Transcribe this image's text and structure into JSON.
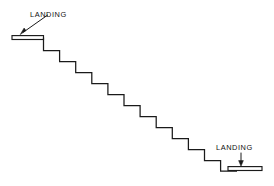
{
  "diagram": {
    "background_color": "#ffffff",
    "line_color": "#1a1a1a",
    "labels": {
      "top_landing": "LANDING",
      "bottom_landing": "LANDING"
    },
    "geometry": {
      "top_landing_platform": {
        "x1": 12,
        "y1": 37.5,
        "x2": 43.5,
        "y2": 37.5,
        "thickness": 4,
        "note": "thin double-line slab at top of stair run"
      },
      "bottom_landing_platform": {
        "x1": 228,
        "y1": 168,
        "x2": 262,
        "y2": 168,
        "thickness": 4,
        "note": "thin double-line slab at foot of stair run"
      },
      "stair_start": {
        "x": 43.5,
        "y": 39.5
      },
      "stair_end": {
        "x": 237,
        "y": 171
      },
      "step_count": 12,
      "tread_width": 16.1,
      "riser_height": 11.0,
      "steps": [
        {
          "tread_x1": 43.5,
          "tread_x2": 59.6,
          "y": 50.5
        },
        {
          "tread_x1": 59.6,
          "tread_x2": 75.7,
          "y": 61.5
        },
        {
          "tread_x1": 75.7,
          "tread_x2": 91.8,
          "y": 72.5
        },
        {
          "tread_x1": 91.8,
          "tread_x2": 107.9,
          "y": 83.5
        },
        {
          "tread_x1": 107.9,
          "tread_x2": 124.0,
          "y": 94.5
        },
        {
          "tread_x1": 124.0,
          "tread_x2": 140.1,
          "y": 105.5
        },
        {
          "tread_x1": 140.1,
          "tread_x2": 156.2,
          "y": 116.5
        },
        {
          "tread_x1": 156.2,
          "tread_x2": 172.3,
          "y": 127.5
        },
        {
          "tread_x1": 172.3,
          "tread_x2": 188.4,
          "y": 138.5
        },
        {
          "tread_x1": 188.4,
          "tread_x2": 204.5,
          "y": 149.5
        },
        {
          "tread_x1": 204.5,
          "tread_x2": 220.6,
          "y": 160.5
        },
        {
          "tread_x1": 220.6,
          "tread_x2": 237.0,
          "y": 171.0
        }
      ],
      "top_leader": {
        "from_x": 48,
        "from_y": 14.5,
        "to_x": 21.5,
        "to_y": 33.5,
        "style": "diagonal arrow pointing down-left to upper landing"
      },
      "bottom_leader": {
        "from_x": 241,
        "from_y": 153,
        "to_x": 241,
        "to_y": 166,
        "style": "vertical arrow pointing down to lower landing"
      },
      "top_label_pos": {
        "x": 30,
        "y": 16.5
      },
      "bottom_label_pos": {
        "x": 216,
        "y": 150
      }
    }
  }
}
